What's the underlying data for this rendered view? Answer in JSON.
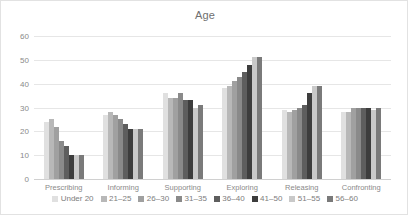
{
  "chart_data": {
    "type": "bar",
    "title": "Age",
    "xlabel": "",
    "ylabel": "",
    "ylim": [
      0,
      60
    ],
    "yticks": [
      60,
      50,
      40,
      30,
      20,
      10,
      0
    ],
    "grid": true,
    "legend_position": "bottom",
    "categories": [
      "Prescribing",
      "Informing",
      "Supporting",
      "Exploring",
      "Releasing",
      "Confronting"
    ],
    "series": [
      {
        "name": "Under 20",
        "color": "#e0e0e0",
        "values": [
          24,
          27,
          36,
          38,
          29,
          28
        ]
      },
      {
        "name": "21–25",
        "color": "#b8b8b8",
        "values": [
          25,
          28,
          34,
          39,
          28,
          28
        ]
      },
      {
        "name": "26–30",
        "color": "#a0a0a0",
        "values": [
          22,
          27,
          34,
          41,
          29,
          30
        ]
      },
      {
        "name": "31–35",
        "color": "#8a8a8a",
        "values": [
          16,
          25,
          36,
          43,
          30,
          30
        ]
      },
      {
        "name": "36–40",
        "color": "#5e5e5e",
        "values": [
          14,
          23,
          33,
          45,
          31,
          30
        ]
      },
      {
        "name": "41–50",
        "color": "#3d3d3d",
        "values": [
          10,
          21,
          33,
          48,
          36,
          30
        ]
      },
      {
        "name": "51–55",
        "color": "#c9c9c9",
        "values": [
          10,
          21,
          30,
          51,
          39,
          29
        ]
      },
      {
        "name": "56–60",
        "color": "#7a7a7a",
        "values": [
          10,
          21,
          31,
          51,
          39,
          30
        ]
      }
    ]
  }
}
